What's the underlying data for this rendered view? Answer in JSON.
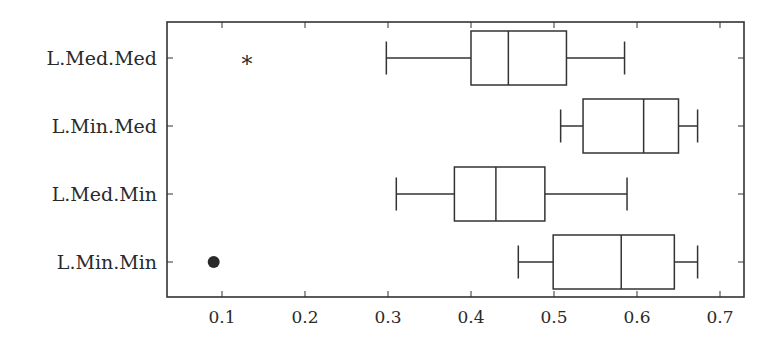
{
  "chart_data": {
    "type": "boxplot",
    "orientation": "horizontal",
    "title": "",
    "xlabel": "",
    "ylabel": "",
    "xlim": [
      0.033,
      0.73
    ],
    "xticks": [
      0.1,
      0.2,
      0.3,
      0.4,
      0.5,
      0.6,
      0.7
    ],
    "xtick_labels": [
      "0.1",
      "0.2",
      "0.3",
      "0.4",
      "0.5",
      "0.6",
      "0.7"
    ],
    "grid": false,
    "categories": [
      "L.Med.Med",
      "L.Min.Med",
      "L.Med.Min",
      "L.Min.Min"
    ],
    "series": [
      {
        "name": "L.Med.Med",
        "whisker_low": 0.298,
        "q1": 0.4,
        "median": 0.445,
        "q3": 0.515,
        "whisker_high": 0.585,
        "outliers": [
          {
            "value": 0.13,
            "marker": "star"
          }
        ]
      },
      {
        "name": "L.Min.Med",
        "whisker_low": 0.508,
        "q1": 0.535,
        "median": 0.608,
        "q3": 0.65,
        "whisker_high": 0.673,
        "outliers": []
      },
      {
        "name": "L.Med.Min",
        "whisker_low": 0.31,
        "q1": 0.38,
        "median": 0.43,
        "q3": 0.489,
        "whisker_high": 0.588,
        "outliers": []
      },
      {
        "name": "L.Min.Min",
        "whisker_low": 0.457,
        "q1": 0.499,
        "median": 0.581,
        "q3": 0.645,
        "whisker_high": 0.673,
        "outliers": [
          {
            "value": 0.09,
            "marker": "dot"
          }
        ]
      }
    ],
    "colors": {
      "line": "#333333",
      "text": "#2a2a2a",
      "marker": "#2a2a2a"
    }
  }
}
